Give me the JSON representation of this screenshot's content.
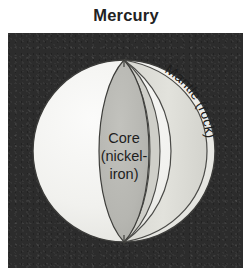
{
  "figure": {
    "title": "Mercury",
    "type": "planet-interior-cutaway-diagram"
  },
  "panel": {
    "background_color": "#2c2c2c",
    "border_color": "#1a1a1a"
  },
  "labels": {
    "mantle": "Mantle (rock)",
    "core_line1": "Core",
    "core_line2": "(nickel-",
    "core_line3": "iron)"
  },
  "layers": [
    {
      "name": "surface",
      "label": "",
      "color": "#f2f2ef",
      "outline_color": "#3a3a3a"
    },
    {
      "name": "mantle",
      "label": "Mantle (rock)",
      "composition": "rock",
      "color": "#dedeD8",
      "outline_color": "#4a4a48"
    },
    {
      "name": "mantle-inner",
      "label": "",
      "color": "#cdcdc7",
      "outline_color": "#4a4a48"
    },
    {
      "name": "core",
      "label": "Core (nickel-iron)",
      "composition": "nickel-iron",
      "color": "#b6b6b1",
      "outline_color": "#3f3f3d"
    }
  ],
  "geometry": {
    "sphere_center_x": 116,
    "sphere_center_y": 118,
    "sphere_radius": 91,
    "cut_top_y": 29,
    "cut_bottom_y": 208
  }
}
